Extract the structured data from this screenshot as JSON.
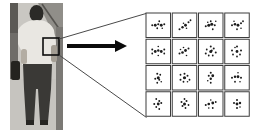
{
  "figure": {
    "colors": {
      "page_bg": "#ffffff",
      "callout_line": "#4a4a4a",
      "arrow": "#0a0a0a",
      "roi_stroke": "#0d0d0d"
    },
    "photo": {
      "colors": {
        "background": "#c9c7c2",
        "left_strip": "#6f6d69",
        "left_strip_top": "#5b5955",
        "wall": "#908e89",
        "wall_shadow": "#55534f",
        "right_band": "#7b7975",
        "ground": "#c6c4bf",
        "hair": "#2b2a27",
        "neck": "#a9a39a",
        "shirt": "#e9e7e2",
        "arm": "#b3ada3",
        "arm_right": "#a49e94",
        "pants": "#3a3936",
        "shoes": "#262522",
        "bag": "#24231f"
      }
    },
    "grid": {
      "x": 146,
      "y": 13,
      "rows": 4,
      "cols": 4,
      "pitch": 26.25,
      "cell": 24.5,
      "cell_fill": "#ffffff",
      "border_color": "#3c3c3c",
      "dot_color": "#1c1c1c",
      "cells": [
        {
          "dots": [
            [
              -6,
              0,
              1
            ],
            [
              -3,
              0,
              1.4
            ],
            [
              0,
              -1,
              1.1
            ],
            [
              3,
              0,
              1.4
            ],
            [
              6,
              -1,
              1
            ],
            [
              1,
              -4,
              0.9
            ],
            [
              -1,
              3,
              0.9
            ],
            [
              4,
              3,
              0.8
            ]
          ]
        },
        {
          "dots": [
            [
              -5,
              4,
              1
            ],
            [
              -2,
              2,
              1.2
            ],
            [
              1,
              0,
              1.4
            ],
            [
              4,
              -3,
              1
            ],
            [
              6,
              -5,
              0.9
            ],
            [
              -1,
              -2,
              0.8
            ],
            [
              2,
              3,
              0.8
            ]
          ]
        },
        {
          "dots": [
            [
              -5,
              1,
              1
            ],
            [
              -2,
              0,
              1.5
            ],
            [
              1,
              -1,
              1.5
            ],
            [
              4,
              0,
              1
            ],
            [
              0,
              -4,
              0.9
            ],
            [
              -3,
              -3,
              0.8
            ],
            [
              2,
              4,
              0.9
            ],
            [
              5,
              -4,
              0.8
            ]
          ]
        },
        {
          "dots": [
            [
              -5,
              0,
              1
            ],
            [
              -2,
              -1,
              1.3
            ],
            [
              1,
              0,
              1.4
            ],
            [
              4,
              -2,
              1
            ],
            [
              6,
              -4,
              0.9
            ],
            [
              -3,
              -4,
              0.8
            ],
            [
              0,
              4,
              0.9
            ],
            [
              4,
              3,
              0.8
            ]
          ]
        },
        {
          "dots": [
            [
              -6,
              -2,
              1
            ],
            [
              -6,
              2,
              0.9
            ],
            [
              -3,
              0,
              1.4
            ],
            [
              0,
              -1,
              1.2
            ],
            [
              3,
              0,
              1.4
            ],
            [
              6,
              -2,
              1
            ],
            [
              6,
              2,
              0.9
            ],
            [
              0,
              -5,
              0.8
            ],
            [
              0,
              4,
              0.8
            ]
          ]
        },
        {
          "dots": [
            [
              -5,
              2,
              1
            ],
            [
              -2,
              1,
              1.3
            ],
            [
              1,
              -1,
              1.4
            ],
            [
              4,
              -3,
              1
            ],
            [
              -1,
              -4,
              0.8
            ],
            [
              2,
              4,
              0.8
            ],
            [
              -4,
              -2,
              0.8
            ]
          ]
        },
        {
          "dots": [
            [
              0,
              -5,
              1
            ],
            [
              3,
              -3,
              1
            ],
            [
              5,
              1,
              1
            ],
            [
              2,
              4,
              0.9
            ],
            [
              -2,
              4,
              0.9
            ],
            [
              -5,
              2,
              1
            ],
            [
              -4,
              -2,
              0.9
            ],
            [
              0,
              0,
              1.5
            ],
            [
              1,
              -1,
              1
            ]
          ]
        },
        {
          "dots": [
            [
              0,
              -5,
              1
            ],
            [
              4,
              -1,
              1
            ],
            [
              3,
              3,
              0.9
            ],
            [
              0,
              5,
              0.9
            ],
            [
              -4,
              3,
              0.9
            ],
            [
              -5,
              -1,
              1
            ],
            [
              -2,
              -4,
              0.8
            ],
            [
              0,
              0,
              1.4
            ]
          ]
        },
        {
          "dots": [
            [
              -1,
              -4,
              1
            ],
            [
              2,
              -3,
              0.9
            ],
            [
              0,
              0,
              1.5
            ],
            [
              -3,
              1,
              1
            ],
            [
              1,
              2,
              1
            ],
            [
              -1,
              5,
              0.9
            ],
            [
              3,
              4,
              0.8
            ]
          ]
        },
        {
          "dots": [
            [
              -4,
              -3,
              0.9
            ],
            [
              0,
              -4,
              1
            ],
            [
              3,
              -2,
              1
            ],
            [
              5,
              2,
              0.9
            ],
            [
              0,
              0,
              1.6
            ],
            [
              -4,
              2,
              1
            ],
            [
              -1,
              4,
              0.9
            ],
            [
              3,
              4,
              0.8
            ]
          ]
        },
        {
          "dots": [
            [
              0,
              -5,
              1
            ],
            [
              -2,
              -2,
              1
            ],
            [
              2,
              -2,
              1.4
            ],
            [
              0,
              1,
              1.2
            ],
            [
              0,
              5,
              0.9
            ],
            [
              -3,
              3,
              0.8
            ]
          ]
        },
        {
          "dots": [
            [
              -5,
              0,
              1
            ],
            [
              -2,
              -1,
              1.2
            ],
            [
              1,
              -1,
              1.4
            ],
            [
              4,
              0,
              1
            ],
            [
              1,
              -5,
              0.8
            ],
            [
              -2,
              4,
              0.9
            ],
            [
              3,
              4,
              0.8
            ]
          ]
        },
        {
          "dots": [
            [
              -2,
              -5,
              0.9
            ],
            [
              1,
              -3,
              1
            ],
            [
              -4,
              0,
              1
            ],
            [
              0,
              0,
              1.4
            ],
            [
              3,
              -1,
              1
            ],
            [
              -2,
              3,
              0.9
            ],
            [
              1,
              5,
              0.9
            ]
          ]
        },
        {
          "dots": [
            [
              0,
              -5,
              0.9
            ],
            [
              -3,
              -2,
              1
            ],
            [
              2,
              -3,
              1
            ],
            [
              0,
              0,
              1.5
            ],
            [
              4,
              1,
              0.9
            ],
            [
              -2,
              2,
              1
            ],
            [
              1,
              4,
              0.9
            ]
          ]
        },
        {
          "dots": [
            [
              -5,
              1,
              1
            ],
            [
              -2,
              0,
              1.3
            ],
            [
              2,
              -1,
              1.4
            ],
            [
              5,
              -2,
              0.9
            ],
            [
              0,
              -4,
              0.8
            ],
            [
              2,
              4,
              0.9
            ],
            [
              -2,
              4,
              0.8
            ]
          ]
        },
        {
          "dots": [
            [
              0,
              -4,
              1
            ],
            [
              -3,
              -1,
              1
            ],
            [
              3,
              -1,
              1.2
            ],
            [
              0,
              0,
              1.4
            ],
            [
              0,
              4,
              1
            ],
            [
              3,
              3,
              0.8
            ]
          ]
        }
      ]
    }
  }
}
